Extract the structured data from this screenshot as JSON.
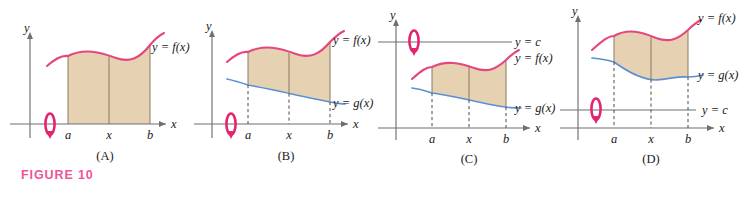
{
  "figure": {
    "caption": "FIGURE 10",
    "caption_color": "#ee5599",
    "curve_f_color": "#e5467c",
    "curve_g_color": "#5b8fd4",
    "region_fill_color": "#e6d2b3",
    "axis_color": "#6f6f6f",
    "rotation_arrow_color": "#e5246f"
  },
  "panels": [
    {
      "letter": "(A)",
      "axis_x_label": "x",
      "axis_y_label": "y",
      "ticks": [
        "a",
        "x",
        "b"
      ],
      "labels": [
        "y = f(x)"
      ],
      "has_g_curve": false,
      "has_level_line": false,
      "rotation_axis": "x-axis"
    },
    {
      "letter": "(B)",
      "axis_x_label": "x",
      "axis_y_label": "y",
      "ticks": [
        "a",
        "x",
        "b"
      ],
      "labels": [
        "y = f(x)",
        "y = g(x)"
      ],
      "has_g_curve": true,
      "has_level_line": false,
      "rotation_axis": "x-axis"
    },
    {
      "letter": "(C)",
      "axis_x_label": "x",
      "axis_y_label": "y",
      "ticks": [
        "a",
        "x",
        "b"
      ],
      "labels": [
        "y = c",
        "y = f(x)",
        "y = g(x)"
      ],
      "has_g_curve": true,
      "has_level_line": true,
      "level_line_label": "y = c",
      "level_line_position": "above-curves",
      "rotation_axis": "y = c"
    },
    {
      "letter": "(D)",
      "axis_x_label": "x",
      "axis_y_label": "y",
      "ticks": [
        "a",
        "x",
        "b"
      ],
      "labels": [
        "y = f(x)",
        "y = g(x)",
        "y = c"
      ],
      "has_g_curve": true,
      "has_level_line": true,
      "level_line_label": "y = c",
      "level_line_position": "below-curves",
      "rotation_axis": "y = c"
    }
  ]
}
